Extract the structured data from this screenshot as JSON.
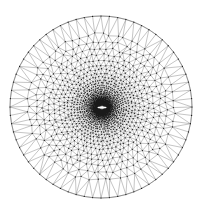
{
  "figure": {
    "title": "",
    "kind": "finite-element-mesh",
    "width": 206,
    "height": 214,
    "background_color": "#ffffff"
  },
  "chart_data": {
    "type": "diagram",
    "subtype": "triangular-mesh",
    "title": "",
    "subtitle": "",
    "xlabel": "",
    "ylabel": "",
    "grid": false,
    "legend": null,
    "annotations": [],
    "domain": {
      "shape": "circle",
      "center_x": 101,
      "center_y": 107,
      "radius": 91,
      "boundary_segments": 68
    },
    "refinement": {
      "focus_x": 102,
      "focus_y": 107.5,
      "feature": "horizontal-slit",
      "slit_half_length": 4.5,
      "slit_half_height": 0.9,
      "min_edge_length": 0.55,
      "max_edge_length": 16.0,
      "grading_exponent": 1.62,
      "ring_count": 34,
      "inner_ring_radius": 2.2
    },
    "style": {
      "edge_color": "#7d7d7d",
      "edge_width": 0.45,
      "node_color": "#1a1a1a",
      "node_radius": 0.62,
      "boundary_color": "#6a6a6a",
      "boundary_width": 0.6,
      "slit_fill": "#ffffff"
    },
    "counts": {
      "nodes_label": "nodes",
      "elements_label": "elements",
      "rings_label": "rings"
    }
  }
}
